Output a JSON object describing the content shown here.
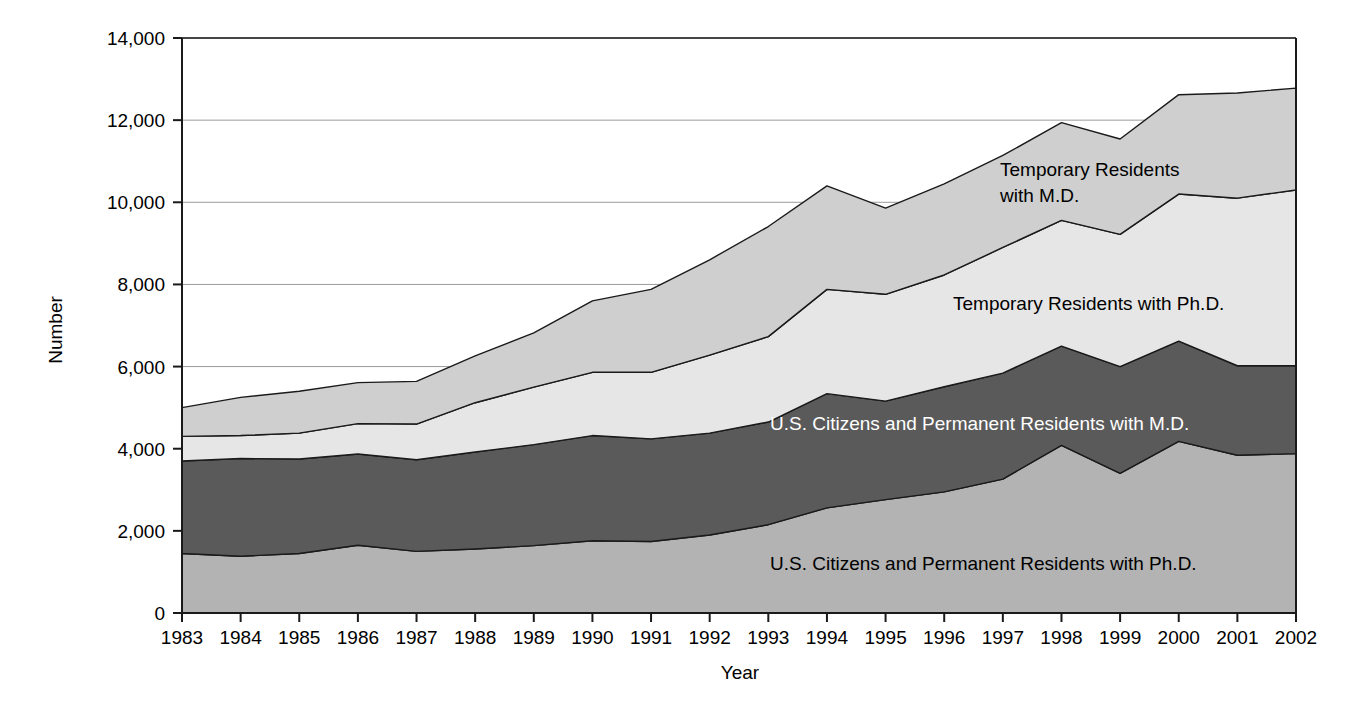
{
  "chart_data": {
    "type": "area",
    "stacked": true,
    "title": "",
    "subtitle": "",
    "xlabel": "Year",
    "ylabel": "Number",
    "grid": true,
    "legend_position": "inline-annotations",
    "xlim": [
      1983,
      2002
    ],
    "ylim": [
      0,
      14000
    ],
    "ytick_labels": [
      "0",
      "2,000",
      "4,000",
      "6,000",
      "8,000",
      "10,000",
      "12,000",
      "14,000"
    ],
    "ytick_values": [
      0,
      2000,
      4000,
      6000,
      8000,
      10000,
      12000,
      14000
    ],
    "categories": [
      1983,
      1984,
      1985,
      1986,
      1987,
      1988,
      1989,
      1990,
      1991,
      1992,
      1993,
      1994,
      1995,
      1996,
      1997,
      1998,
      1999,
      2000,
      2001,
      2002
    ],
    "xtick_labels": [
      "1983",
      "1984",
      "1985",
      "1986",
      "1987",
      "1988",
      "1989",
      "1990",
      "1991",
      "1992",
      "1993",
      "1994",
      "1995",
      "1996",
      "1997",
      "1998",
      "1999",
      "2000",
      "2001",
      "2002"
    ],
    "series": [
      {
        "name": "U.S. Citizens and Permanent Residents with Ph.D.",
        "color": "#b3b3b3",
        "label_inverse": false,
        "values": [
          1450,
          1380,
          1450,
          1650,
          1500,
          1560,
          1640,
          1760,
          1740,
          1900,
          2150,
          2560,
          2760,
          2950,
          3260,
          4080,
          3400,
          4180,
          3840,
          3880
        ]
      },
      {
        "name": "U.S. Citizens and Permanent Residents with M.D.",
        "color": "#5a5a5a",
        "label_inverse": true,
        "values": [
          2250,
          2380,
          2300,
          2220,
          2230,
          2360,
          2460,
          2560,
          2500,
          2480,
          2500,
          2780,
          2400,
          2560,
          2580,
          2420,
          2600,
          2440,
          2180,
          2140
        ]
      },
      {
        "name": "Temporary Residents with Ph.D.",
        "color": "#e6e6e6",
        "label_inverse": false,
        "values": [
          600,
          560,
          630,
          740,
          870,
          1200,
          1400,
          1540,
          1620,
          1900,
          2080,
          2540,
          2600,
          2720,
          3060,
          3060,
          3220,
          3580,
          4080,
          4280
        ]
      },
      {
        "name": "Temporary Residents with M.D.",
        "color": "#cfcfcf",
        "label_inverse": false,
        "values": [
          700,
          930,
          1020,
          1000,
          1040,
          1140,
          1320,
          1740,
          2020,
          2320,
          2680,
          2520,
          2100,
          2220,
          2240,
          2380,
          2320,
          2420,
          2560,
          2480
        ]
      }
    ],
    "series_totals": [
      5000,
      5250,
      5400,
      5610,
      5640,
      6260,
      6820,
      7600,
      7880,
      8600,
      9410,
      10400,
      9860,
      10450,
      11140,
      11940,
      11540,
      12620,
      12660,
      12780
    ],
    "annotations": [
      {
        "text": "Temporary Residents",
        "line2": "with M.D.",
        "x": 1000,
        "y": 176,
        "inverse": false
      },
      {
        "text": "Temporary Residents with Ph.D.",
        "line2": "",
        "x": 953,
        "y": 310,
        "inverse": false
      },
      {
        "text": "U.S. Citizens and Permanent Residents with M.D.",
        "line2": "",
        "x": 770,
        "y": 430,
        "inverse": true
      },
      {
        "text": "U.S. Citizens and Permanent Residents with Ph.D.",
        "line2": "",
        "x": 770,
        "y": 570,
        "inverse": false
      }
    ]
  }
}
